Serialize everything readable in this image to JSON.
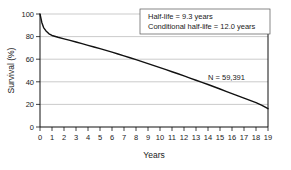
{
  "chart_data": {
    "type": "line",
    "title": "",
    "xlabel": "Years",
    "ylabel": "Survival (%)",
    "xlim": [
      0,
      19
    ],
    "ylim": [
      0,
      100
    ],
    "grid": "horizontal",
    "legend": "none",
    "xticks": [
      "0",
      "1",
      "2",
      "3",
      "4",
      "5",
      "6",
      "7",
      "8",
      "9",
      "10",
      "11",
      "12",
      "13",
      "14",
      "15",
      "16",
      "17",
      "18",
      "19"
    ],
    "yticks": [
      "0",
      "20",
      "40",
      "60",
      "80",
      "100"
    ],
    "series": [
      {
        "name": "Survival",
        "color": "#111111",
        "x": [
          0,
          0.15,
          0.3,
          0.5,
          0.75,
          1,
          1.5,
          2,
          2.5,
          3,
          3.5,
          4,
          4.5,
          5,
          5.5,
          6,
          6.5,
          7,
          7.5,
          8,
          8.5,
          9,
          9.5,
          10,
          10.5,
          11,
          11.5,
          12,
          12.5,
          13,
          13.5,
          14,
          14.5,
          15,
          15.5,
          16,
          16.5,
          17,
          17.5,
          18,
          18.5,
          19
        ],
        "values": [
          100,
          92.5,
          88,
          85,
          82.5,
          81,
          79.4,
          78,
          76.6,
          75.2,
          73.8,
          72.3,
          70.8,
          69.3,
          67.8,
          66.2,
          64.6,
          63,
          61.3,
          59.6,
          57.9,
          56.1,
          54.3,
          52.5,
          50.7,
          48.9,
          47.1,
          45.2,
          43.3,
          41.4,
          39.5,
          37.6,
          35.6,
          33.6,
          31.6,
          29.6,
          27.6,
          25.6,
          23.6,
          21.6,
          19.2,
          16.2
        ]
      }
    ],
    "annotations": [
      {
        "name": "half-life-box",
        "lines": [
          "Half-life = 9.3 years",
          "Conditional half-life = 12.0 years"
        ],
        "boxed": true
      },
      {
        "name": "sample-size",
        "lines": [
          "N = 59,391"
        ],
        "boxed": false
      }
    ]
  }
}
